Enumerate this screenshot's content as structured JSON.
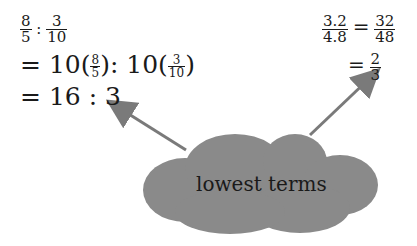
{
  "left_work": {
    "line1": {
      "a_num": "8",
      "a_den": "5",
      "sep": ":",
      "b_num": "3",
      "b_den": "10"
    },
    "line2": {
      "eq": "=",
      "c1": "10(",
      "a_num": "8",
      "a_den": "5",
      "close1": ")",
      "sep": ":",
      "c2": "10(",
      "b_num": "3",
      "b_den": "10",
      "close2": ")"
    },
    "line3": {
      "eq": "=",
      "value": "16 : 3"
    }
  },
  "right_work": {
    "line1": {
      "a_num": "3.2",
      "a_den": "4.8",
      "eq": "=",
      "b_num": "32",
      "b_den": "48"
    },
    "line2": {
      "eq": "=",
      "c_num": "2",
      "c_den": "3"
    }
  },
  "cloud": {
    "label": "lowest terms",
    "fill": "#8a8a8a"
  },
  "arrow_color": "#7a7a7a"
}
